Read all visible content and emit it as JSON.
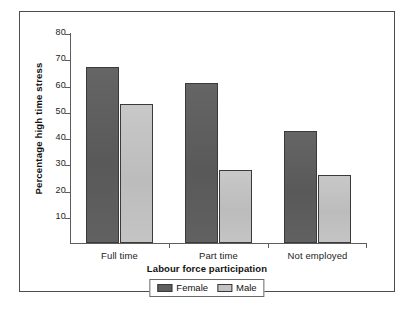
{
  "chart_data": {
    "type": "bar",
    "title": "",
    "subtitle": "",
    "xlabel": "Labour force participation",
    "ylabel": "Percentage high time stress",
    "categories": [
      "Full time",
      "Part time",
      "Not employed"
    ],
    "series": [
      {
        "name": "Female",
        "color": "#5f5f5f",
        "values": [
          67,
          61,
          42.5
        ]
      },
      {
        "name": "Male",
        "color": "#c2c2c2",
        "values": [
          53,
          28,
          26
        ]
      }
    ],
    "ylim": [
      0,
      80
    ],
    "ytick_step": 10,
    "yticks": [
      10,
      20,
      30,
      40,
      50,
      60,
      70,
      80
    ],
    "ytick_labels": [
      "10",
      "20",
      "30",
      "40",
      "50",
      "60",
      "70",
      "80"
    ],
    "grid": false,
    "legend_position": "bottom-center",
    "axis_color": "#5d5d5d",
    "bar_outline_color": "#3a3a3a",
    "frame_color": "#4c4c4c"
  }
}
